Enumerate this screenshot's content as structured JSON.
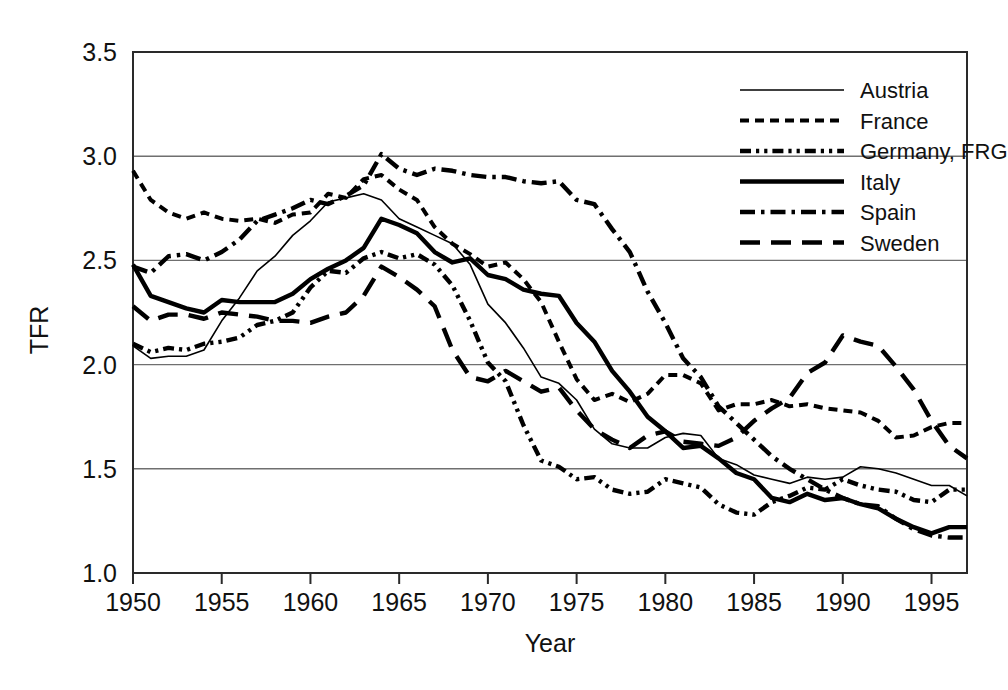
{
  "chart_data": {
    "type": "line",
    "title": "",
    "xlabel": "Year",
    "ylabel": "TFR",
    "xlim": [
      1950,
      1997
    ],
    "ylim": [
      1.0,
      3.5
    ],
    "grid": true,
    "grid_axis": "y",
    "legend_position": "top-right",
    "x_ticks": [
      1950,
      1955,
      1960,
      1965,
      1970,
      1975,
      1980,
      1985,
      1990,
      1995
    ],
    "x_tick_labels": [
      "1950",
      "1955",
      "1960",
      "1965",
      "1970",
      "1975",
      "1980",
      "1985",
      "1990",
      "1995"
    ],
    "y_ticks": [
      1.0,
      1.5,
      2.0,
      2.5,
      3.0,
      3.5
    ],
    "y_tick_labels": [
      "1.0",
      "1.5",
      "2.0",
      "2.5",
      "3.0",
      "3.5"
    ],
    "x": [
      1950,
      1951,
      1952,
      1953,
      1954,
      1955,
      1956,
      1957,
      1958,
      1959,
      1960,
      1961,
      1962,
      1963,
      1964,
      1965,
      1966,
      1967,
      1968,
      1969,
      1970,
      1971,
      1972,
      1973,
      1974,
      1975,
      1976,
      1977,
      1978,
      1979,
      1980,
      1981,
      1982,
      1983,
      1984,
      1985,
      1986,
      1987,
      1988,
      1989,
      1990,
      1991,
      1992,
      1993,
      1994,
      1995,
      1996,
      1997
    ],
    "series": [
      {
        "name": "Austria",
        "line_style": "solid",
        "line_width": "thin",
        "values": [
          2.09,
          2.03,
          2.04,
          2.04,
          2.07,
          2.21,
          2.32,
          2.45,
          2.52,
          2.62,
          2.69,
          2.78,
          2.8,
          2.82,
          2.79,
          2.7,
          2.66,
          2.62,
          2.58,
          2.48,
          2.29,
          2.2,
          2.08,
          1.94,
          1.91,
          1.83,
          1.69,
          1.62,
          1.6,
          1.6,
          1.65,
          1.67,
          1.66,
          1.55,
          1.52,
          1.47,
          1.45,
          1.43,
          1.46,
          1.45,
          1.46,
          1.51,
          1.5,
          1.48,
          1.45,
          1.42,
          1.42,
          1.37
        ]
      },
      {
        "name": "France",
        "line_style": "dashed",
        "line_width": "medium",
        "values": [
          2.93,
          2.79,
          2.73,
          2.7,
          2.73,
          2.7,
          2.69,
          2.7,
          2.68,
          2.72,
          2.73,
          2.82,
          2.8,
          2.89,
          2.91,
          2.84,
          2.79,
          2.66,
          2.58,
          2.53,
          2.47,
          2.49,
          2.41,
          2.3,
          2.11,
          1.93,
          1.83,
          1.86,
          1.82,
          1.86,
          1.95,
          1.95,
          1.91,
          1.78,
          1.81,
          1.81,
          1.83,
          1.8,
          1.81,
          1.79,
          1.78,
          1.77,
          1.73,
          1.65,
          1.66,
          1.7,
          1.72,
          1.72
        ]
      },
      {
        "name": "Germany, FRG",
        "line_style": "dash-dot-dot",
        "line_width": "thick",
        "values": [
          2.1,
          2.06,
          2.08,
          2.07,
          2.1,
          2.11,
          2.13,
          2.19,
          2.21,
          2.25,
          2.37,
          2.45,
          2.44,
          2.51,
          2.54,
          2.51,
          2.53,
          2.48,
          2.38,
          2.21,
          2.01,
          1.92,
          1.71,
          1.54,
          1.51,
          1.45,
          1.46,
          1.4,
          1.38,
          1.39,
          1.45,
          1.43,
          1.41,
          1.33,
          1.29,
          1.28,
          1.34,
          1.37,
          1.41,
          1.4,
          1.45,
          1.42,
          1.4,
          1.39,
          1.35,
          1.34,
          1.4,
          1.4
        ]
      },
      {
        "name": "Italy",
        "line_style": "solid",
        "line_width": "thick",
        "values": [
          2.48,
          2.33,
          2.3,
          2.27,
          2.25,
          2.31,
          2.3,
          2.3,
          2.3,
          2.34,
          2.41,
          2.46,
          2.5,
          2.56,
          2.7,
          2.67,
          2.63,
          2.54,
          2.49,
          2.51,
          2.43,
          2.41,
          2.36,
          2.34,
          2.33,
          2.2,
          2.11,
          1.97,
          1.87,
          1.75,
          1.68,
          1.6,
          1.61,
          1.55,
          1.48,
          1.45,
          1.36,
          1.34,
          1.38,
          1.35,
          1.36,
          1.33,
          1.31,
          1.26,
          1.22,
          1.19,
          1.22,
          1.22
        ]
      },
      {
        "name": "Spain",
        "line_style": "dash-dot",
        "line_width": "thick",
        "values": [
          2.47,
          2.44,
          2.52,
          2.53,
          2.5,
          2.54,
          2.6,
          2.69,
          2.72,
          2.75,
          2.79,
          2.77,
          2.81,
          2.86,
          3.01,
          2.94,
          2.91,
          2.94,
          2.93,
          2.91,
          2.9,
          2.9,
          2.88,
          2.87,
          2.88,
          2.79,
          2.77,
          2.65,
          2.54,
          2.35,
          2.2,
          2.03,
          1.94,
          1.8,
          1.72,
          1.64,
          1.56,
          1.5,
          1.45,
          1.4,
          1.36,
          1.33,
          1.32,
          1.26,
          1.21,
          1.18,
          1.17,
          1.17
        ]
      },
      {
        "name": "Sweden",
        "line_style": "long-dash",
        "line_width": "thick",
        "values": [
          2.28,
          2.21,
          2.24,
          2.24,
          2.22,
          2.25,
          2.24,
          2.23,
          2.21,
          2.21,
          2.2,
          2.23,
          2.25,
          2.33,
          2.47,
          2.42,
          2.36,
          2.28,
          2.07,
          1.94,
          1.92,
          1.97,
          1.92,
          1.87,
          1.89,
          1.78,
          1.69,
          1.64,
          1.6,
          1.66,
          1.68,
          1.63,
          1.62,
          1.61,
          1.65,
          1.73,
          1.79,
          1.84,
          1.96,
          2.01,
          2.14,
          2.11,
          2.09,
          1.99,
          1.88,
          1.73,
          1.61,
          1.55
        ]
      }
    ]
  },
  "axes": {
    "y_axis_title": "TFR",
    "x_axis_title": "Year"
  },
  "legend": {
    "entries": [
      {
        "label": "Austria"
      },
      {
        "label": "France"
      },
      {
        "label": "Germany, FRG"
      },
      {
        "label": "Italy"
      },
      {
        "label": "Spain"
      },
      {
        "label": "Sweden"
      }
    ]
  },
  "colors": {
    "line": "#000000",
    "grid": "#6f6f6f",
    "frame": "#2a2a2a",
    "background": "#ffffff",
    "text": "#111111"
  }
}
